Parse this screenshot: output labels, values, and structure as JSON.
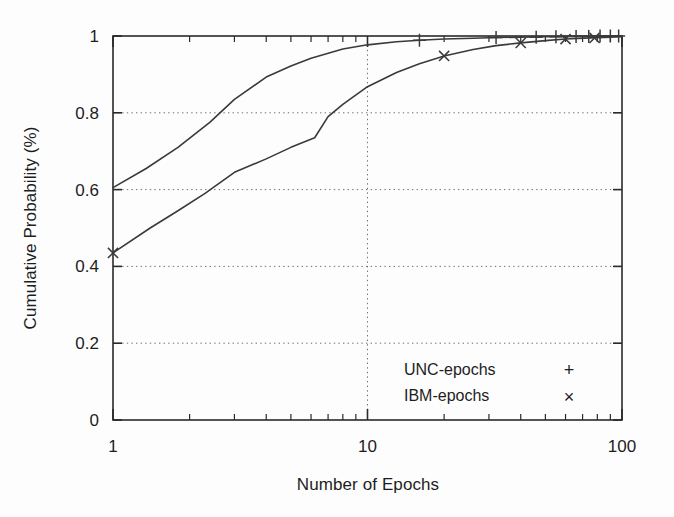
{
  "chart_data": {
    "type": "line",
    "title": "",
    "xlabel": "Number of Epochs",
    "ylabel": "Cumulative Probability (%)",
    "xscale": "log",
    "xlim": [
      1,
      100
    ],
    "ylim": [
      0,
      1
    ],
    "grid": true,
    "grid_style": "dotted",
    "legend_position": "lower right",
    "xticks": [
      1,
      10,
      100
    ],
    "xtick_labels": [
      "1",
      "10",
      "100"
    ],
    "xminor_ticks": [
      2,
      3,
      4,
      5,
      6,
      7,
      8,
      9,
      20,
      30,
      40,
      50,
      60,
      70,
      80,
      90
    ],
    "yticks": [
      0,
      0.2,
      0.4,
      0.6,
      0.8,
      1
    ],
    "ytick_labels": [
      "0",
      "0.2",
      "0.4",
      "0.6",
      "0.8",
      "1"
    ],
    "series": [
      {
        "name": "UNC-epochs",
        "marker": "+",
        "color": "#3a3a3a",
        "points": [
          [
            1,
            0.605
          ],
          [
            1.35,
            0.655
          ],
          [
            1.8,
            0.71
          ],
          [
            2.4,
            0.775
          ],
          [
            3.0,
            0.835
          ],
          [
            4.0,
            0.893
          ],
          [
            5.0,
            0.922
          ],
          [
            6.0,
            0.942
          ],
          [
            8.0,
            0.966
          ],
          [
            10,
            0.977
          ],
          [
            13,
            0.985
          ],
          [
            16,
            0.989
          ],
          [
            20,
            0.992
          ],
          [
            26,
            0.994
          ],
          [
            32,
            0.996
          ],
          [
            40,
            0.997
          ],
          [
            50,
            0.998
          ],
          [
            60,
            0.999
          ],
          [
            70,
            0.999
          ],
          [
            85,
            1.0
          ],
          [
            100,
            1.0
          ]
        ],
        "marker_points": [
          [
            16,
            0.989
          ],
          [
            32,
            0.996
          ],
          [
            46,
            0.997
          ],
          [
            55,
            0.998
          ],
          [
            66,
            0.999
          ],
          [
            74,
            0.999
          ],
          [
            82,
            1.0
          ],
          [
            90,
            1.0
          ],
          [
            97,
            1.0
          ]
        ]
      },
      {
        "name": "IBM-epochs",
        "marker": "×",
        "color": "#3a3a3a",
        "points": [
          [
            1,
            0.435
          ],
          [
            1.4,
            0.5
          ],
          [
            1.8,
            0.545
          ],
          [
            2.3,
            0.59
          ],
          [
            3.0,
            0.645
          ],
          [
            4.0,
            0.68
          ],
          [
            5.0,
            0.71
          ],
          [
            6.2,
            0.735
          ],
          [
            7.0,
            0.79
          ],
          [
            8.0,
            0.822
          ],
          [
            10,
            0.868
          ],
          [
            13,
            0.905
          ],
          [
            16,
            0.928
          ],
          [
            20,
            0.948
          ],
          [
            26,
            0.965
          ],
          [
            32,
            0.975
          ],
          [
            40,
            0.982
          ],
          [
            50,
            0.988
          ],
          [
            60,
            0.992
          ],
          [
            75,
            0.995
          ],
          [
            90,
            0.997
          ],
          [
            100,
            0.998
          ]
        ],
        "marker_points": [
          [
            1,
            0.435
          ],
          [
            20,
            0.948
          ],
          [
            40,
            0.982
          ],
          [
            60,
            0.992
          ],
          [
            78,
            0.995
          ]
        ]
      }
    ],
    "legend_entries": [
      {
        "label": "UNC-epochs",
        "marker": "+"
      },
      {
        "label": "IBM-epochs",
        "marker": "×"
      }
    ]
  },
  "colors": {
    "axis": "#2a2a2a",
    "grid": "#707070",
    "curve": "#3a3a3a",
    "text": "#1d1d1d",
    "background": "#fdfdfd"
  }
}
